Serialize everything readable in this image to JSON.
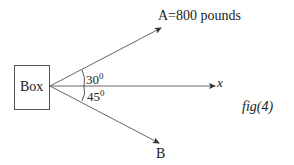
{
  "diagram": {
    "box_label": "Box",
    "vector_a_label": "A=800 pounds",
    "vector_b_label": "B",
    "x_axis_label": "x",
    "angle_a": "30",
    "angle_b": "45",
    "degree_symbol": "0",
    "figure_label": "fig(4)",
    "colors": {
      "line": "#444444",
      "text": "#222222",
      "background": "#ffffff"
    }
  }
}
